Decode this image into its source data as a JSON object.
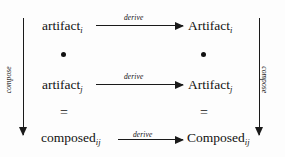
{
  "diagram": {
    "background_color": "#fdfdfd",
    "ink_color": "#111111",
    "nodes": [
      {
        "id": "artifact-i",
        "base": "artifact",
        "subscript": "i",
        "row": 1,
        "column": "left"
      },
      {
        "id": "Artifact-I",
        "base": "Artifact",
        "subscript": "i",
        "row": 1,
        "column": "right"
      },
      {
        "id": "artifact-j",
        "base": "artifact",
        "subscript": "j",
        "row": 2,
        "column": "left"
      },
      {
        "id": "Artifact-J",
        "base": "Artifact",
        "subscript": "j",
        "row": 2,
        "column": "right"
      },
      {
        "id": "composed-ij",
        "base": "composed",
        "subscript": "ij",
        "row": 3,
        "column": "left"
      },
      {
        "id": "Composed-IJ",
        "base": "Composed",
        "subscript": "ij",
        "row": 3,
        "column": "right"
      }
    ],
    "separators": {
      "bullet_glyph": "•",
      "equals_glyph": "=",
      "between_row1_row2": "bullet",
      "between_row2_row3": "equals"
    },
    "horizontal_arrows": [
      {
        "id": "derive-1",
        "label": "derive",
        "from": "artifact-i",
        "to": "Artifact-I",
        "direction": "right"
      },
      {
        "id": "derive-2",
        "label": "derive",
        "from": "artifact-j",
        "to": "Artifact-J",
        "direction": "right"
      },
      {
        "id": "derive-3",
        "label": "derive",
        "from": "composed-ij",
        "to": "Composed-IJ",
        "direction": "right"
      }
    ],
    "vertical_arrows": [
      {
        "id": "compose-left",
        "label": "compose",
        "from": "artifact-i",
        "to": "composed-ij",
        "direction": "down",
        "side": "left"
      },
      {
        "id": "compose-right",
        "label": "compose",
        "from": "Artifact-I",
        "to": "Composed-IJ",
        "direction": "down",
        "side": "right"
      }
    ]
  }
}
